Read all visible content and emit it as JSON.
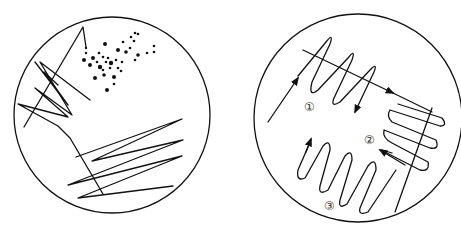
{
  "figure": {
    "colors": {
      "line": "#111111",
      "label": "#333333",
      "background": "#ffffff"
    }
  },
  "left_dish": {
    "name": "random-streak-dish",
    "features": [
      "zigzag streak lines upper-left",
      "scattered colony dots upper-center",
      "zigzag streak lines lower-right"
    ]
  },
  "right_dish": {
    "name": "quadrant-streak-dish",
    "regions": [
      {
        "id": 1,
        "label": "①"
      },
      {
        "id": 2,
        "label": "②"
      },
      {
        "id": 3,
        "label": "③"
      }
    ]
  }
}
